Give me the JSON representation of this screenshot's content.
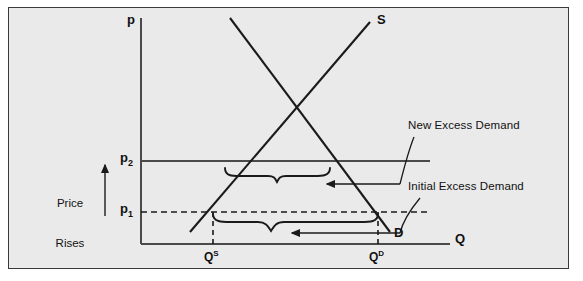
{
  "figure": {
    "kind": "supply-demand-diagram",
    "background_color": "#eaeaea",
    "border_color": "#3a3a3a",
    "ink_color": "#1a1a1a",
    "width": 583,
    "height": 281
  },
  "axes": {
    "vertical_label": "p",
    "horizontal_label": "Q",
    "origin_px": [
      141,
      244
    ],
    "vertical_top_px": [
      141,
      18
    ],
    "horizontal_right_px": [
      450,
      244
    ]
  },
  "price_ticks": [
    {
      "id": "p2",
      "label": "p",
      "subscript": "2",
      "y_px": 161,
      "line_style": "solid",
      "line_end_x_px": 430
    },
    {
      "id": "p1",
      "label": "p",
      "subscript": "1",
      "y_px": 212,
      "line_style": "dashed",
      "line_end_x_px": 430
    }
  ],
  "quantity_ticks": [
    {
      "id": "QS",
      "label": "Q",
      "superscript": "S",
      "x_px": 213,
      "line_style": "dashed"
    },
    {
      "id": "QD",
      "label": "Q",
      "superscript": "D",
      "x_px": 378,
      "line_style": "dashed"
    }
  ],
  "curves": [
    {
      "id": "supply",
      "label": "S",
      "slope": "upward",
      "from_px": [
        190,
        232
      ],
      "to_px": [
        370,
        22
      ],
      "label_px": [
        377,
        14
      ]
    },
    {
      "id": "demand",
      "label": "D",
      "slope": "downward",
      "from_px": [
        230,
        18
      ],
      "to_px": [
        390,
        232
      ],
      "label_px": [
        394,
        228
      ]
    }
  ],
  "annotations": [
    {
      "id": "new-excess-demand",
      "text": "New Excess Demand",
      "text_px": [
        408,
        121
      ],
      "brace_span_px": [
        225,
        330
      ],
      "brace_y_px": 172,
      "arrow_from_px": [
        400,
        184
      ],
      "arrow_to_px": [
        325,
        184
      ]
    },
    {
      "id": "initial-excess-demand",
      "text": "Initial Excess Demand",
      "text_px": [
        408,
        182
      ],
      "brace_span_px": [
        213,
        378
      ],
      "brace_y_px": 218,
      "arrow_from_px": [
        400,
        233
      ],
      "arrow_to_px": [
        290,
        233
      ]
    }
  ],
  "side_note": {
    "id": "price-rises",
    "lines": [
      "Price",
      "Rises"
    ],
    "text_px": [
      44,
      170
    ],
    "arrow_x_px": [
      105
    ],
    "arrow_from_y_px": 216,
    "arrow_to_y_px": 164,
    "direction": "up"
  }
}
